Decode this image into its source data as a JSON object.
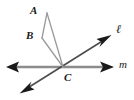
{
  "figure": {
    "kind": "geometry-diagram",
    "width": 134,
    "height": 100,
    "background_color": "#ffffff",
    "labels": {
      "point_a": "A",
      "point_b": "B",
      "point_c": "C",
      "line_ell": "ℓ",
      "line_m": "m"
    },
    "colors": {
      "line_m": "#8c8c8c",
      "line_ell": "#4d4d4d",
      "ray_ca": "#9a9a9a",
      "ray_cb": "#9a9a9a",
      "segment_ab": "#9a9a9a",
      "label": "#1a1a1a",
      "arrowhead": "#1a1a1a"
    },
    "points": {
      "A": {
        "x": 47,
        "y": 13
      },
      "B": {
        "x": 42,
        "y": 38
      },
      "C": {
        "x": 63,
        "y": 67
      }
    },
    "lines": [
      {
        "name": "line-m",
        "label": "m",
        "from": {
          "x": 8,
          "y": 67
        },
        "to": {
          "x": 113,
          "y": 67
        },
        "arrows": "both",
        "stroke": "#8c8c8c",
        "stroke_width": 2.2
      },
      {
        "name": "line-ell",
        "label": "ℓ",
        "from": {
          "x": 21,
          "y": 92
        },
        "to": {
          "x": 110,
          "y": 36
        },
        "arrows": "both",
        "stroke": "#4d4d4d",
        "stroke_width": 1.5
      }
    ],
    "segments": [
      {
        "name": "segment-ab",
        "from": "A",
        "to": "B",
        "stroke": "#9a9a9a",
        "stroke_width": 1.2
      },
      {
        "name": "ray-ac",
        "from": "A",
        "to": "C",
        "stroke": "#9a9a9a",
        "stroke_width": 1.2
      },
      {
        "name": "ray-bc",
        "from": "B",
        "to": "C",
        "stroke": "#9a9a9a",
        "stroke_width": 1.2
      }
    ]
  }
}
